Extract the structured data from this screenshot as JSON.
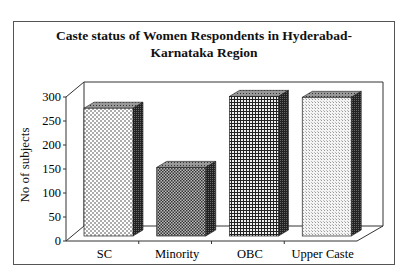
{
  "chart_data": {
    "type": "bar",
    "style": "3d-column",
    "title_lines": [
      "Caste status of Women  Respondents in Hyderabad-",
      "Karnataka Region"
    ],
    "xlabel": "",
    "ylabel": "No of subjects",
    "categories": [
      "SC",
      "Minority",
      "OBC",
      "Upper Caste"
    ],
    "values": [
      270,
      145,
      295,
      293
    ],
    "ylim": [
      0,
      300
    ],
    "yticks": [
      0,
      50,
      100,
      150,
      200,
      250,
      300
    ],
    "grid": false,
    "legend": null,
    "patterns": [
      "dotted",
      "fine-checker",
      "dense-grid",
      "light-stipple"
    ]
  }
}
